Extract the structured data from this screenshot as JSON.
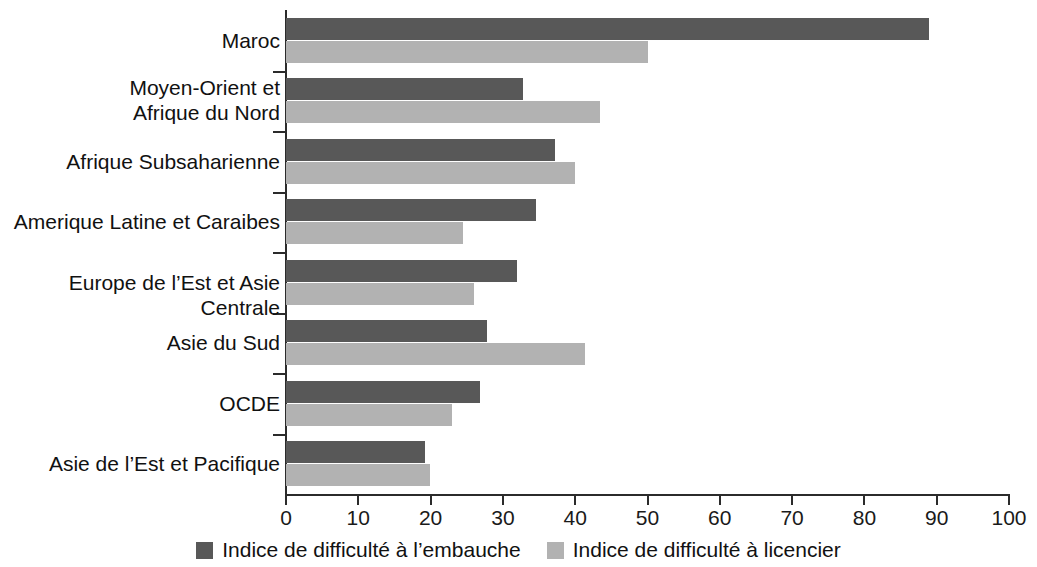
{
  "chart_data": {
    "type": "bar",
    "orientation": "horizontal",
    "title": "",
    "subtitle": "",
    "xlabel": "",
    "ylabel": "",
    "xlim": [
      0,
      100
    ],
    "xticks": [
      0,
      10,
      20,
      30,
      40,
      50,
      60,
      70,
      80,
      90,
      100
    ],
    "xtick_labels": [
      "0",
      "10",
      "20",
      "30",
      "40",
      "50",
      "60",
      "70",
      "80",
      "90",
      "100"
    ],
    "grid": false,
    "legend_position": "bottom-center",
    "categories": [
      "Maroc",
      "Moyen-Orient et\nAfrique du Nord",
      "Afrique Subsaharienne",
      "Amerique Latine et Caraibes",
      "Europe de l’Est et Asie Centrale",
      "Asie du Sud",
      "OCDE",
      "Asie de l’Est et Pacifique"
    ],
    "series": [
      {
        "name": "Indice de difficulté à l’embauche",
        "color": "#585858",
        "values": [
          89.0,
          32.8,
          37.2,
          34.6,
          32.0,
          27.8,
          26.8,
          19.2
        ]
      },
      {
        "name": "Indice de difficulté à licencier",
        "color": "#b2b2b2",
        "values": [
          50.0,
          43.4,
          40.0,
          24.5,
          26.0,
          41.4,
          23.0,
          19.9
        ]
      }
    ]
  },
  "legend": {
    "items": [
      {
        "label": "Indice de difficulté à l’embauche",
        "color": "#585858"
      },
      {
        "label": "Indice de difficulté à licencier",
        "color": "#b2b2b2"
      }
    ]
  },
  "axis": {
    "x_tick_labels": [
      "0",
      "10",
      "20",
      "30",
      "40",
      "50",
      "60",
      "70",
      "80",
      "90",
      "100"
    ]
  },
  "colors": {
    "series_hire": "#585858",
    "series_fire": "#b2b2b2",
    "axis": "#2b2b2b",
    "text": "#111111",
    "background": "#ffffff"
  }
}
